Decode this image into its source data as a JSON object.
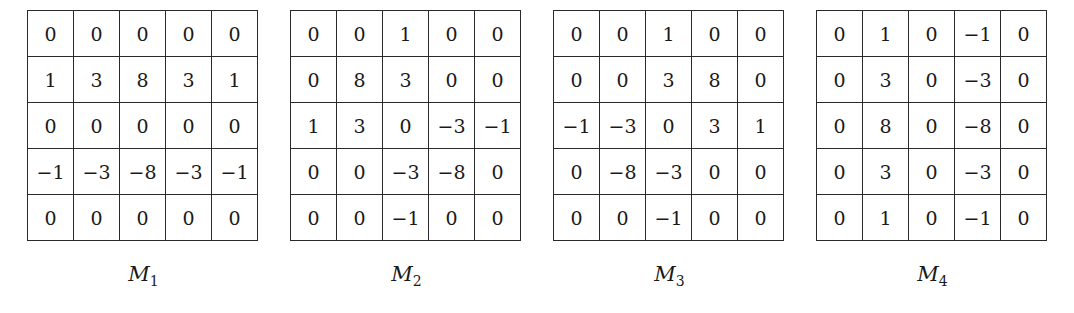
{
  "figure": {
    "matrices": [
      {
        "name": "M",
        "subscript": "1",
        "rows": [
          [
            "0",
            "0",
            "0",
            "0",
            "0"
          ],
          [
            "1",
            "3",
            "8",
            "3",
            "1"
          ],
          [
            "0",
            "0",
            "0",
            "0",
            "0"
          ],
          [
            "−1",
            "−3",
            "−8",
            "−3",
            "−1"
          ],
          [
            "0",
            "0",
            "0",
            "0",
            "0"
          ]
        ]
      },
      {
        "name": "M",
        "subscript": "2",
        "rows": [
          [
            "0",
            "0",
            "1",
            "0",
            "0"
          ],
          [
            "0",
            "8",
            "3",
            "0",
            "0"
          ],
          [
            "1",
            "3",
            "0",
            "−3",
            "−1"
          ],
          [
            "0",
            "0",
            "−3",
            "−8",
            "0"
          ],
          [
            "0",
            "0",
            "−1",
            "0",
            "0"
          ]
        ]
      },
      {
        "name": "M",
        "subscript": "3",
        "rows": [
          [
            "0",
            "0",
            "1",
            "0",
            "0"
          ],
          [
            "0",
            "0",
            "3",
            "8",
            "0"
          ],
          [
            "−1",
            "−3",
            "0",
            "3",
            "1"
          ],
          [
            "0",
            "−8",
            "−3",
            "0",
            "0"
          ],
          [
            "0",
            "0",
            "−1",
            "0",
            "0"
          ]
        ]
      },
      {
        "name": "M",
        "subscript": "4",
        "rows": [
          [
            "0",
            "1",
            "0",
            "−1",
            "0"
          ],
          [
            "0",
            "3",
            "0",
            "−3",
            "0"
          ],
          [
            "0",
            "8",
            "0",
            "−8",
            "0"
          ],
          [
            "0",
            "3",
            "0",
            "−3",
            "0"
          ],
          [
            "0",
            "1",
            "0",
            "−1",
            "0"
          ]
        ]
      }
    ]
  }
}
